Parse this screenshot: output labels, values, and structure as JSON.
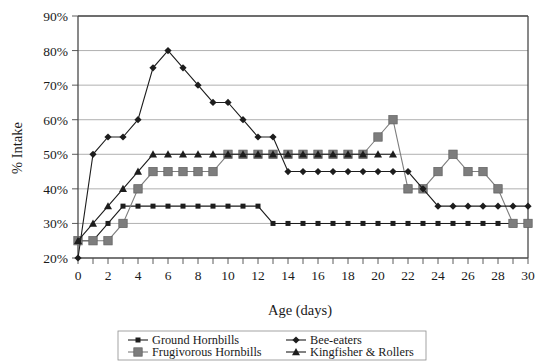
{
  "chart_data": {
    "type": "line",
    "title": "",
    "xlabel": "Age (days)",
    "ylabel": "% Intake",
    "xlim": [
      0,
      30
    ],
    "ylim": [
      20,
      90
    ],
    "x_tick_step": 2,
    "x_minor_tick_step": 1,
    "y_tick_step": 10,
    "grid": "horizontal",
    "y_tick_labels": [
      "90%",
      "80%",
      "70%",
      "60%",
      "50%",
      "40%",
      "30%",
      "20%"
    ],
    "x_tick_labels": [
      "0",
      "2",
      "4",
      "6",
      "8",
      "10",
      "12",
      "14",
      "16",
      "18",
      "20",
      "22",
      "24",
      "26",
      "28",
      "30"
    ],
    "legend_position": "bottom",
    "series": [
      {
        "name": "Ground Hornbills",
        "marker": "square-small",
        "color": "#1d1d1d",
        "x": [
          0,
          1,
          2,
          3,
          4,
          5,
          6,
          7,
          8,
          9,
          10,
          11,
          12,
          13,
          14,
          15,
          16,
          17,
          18,
          19,
          20,
          21,
          22,
          23,
          24,
          25,
          26,
          27,
          28,
          29,
          30
        ],
        "y": [
          25,
          25,
          30,
          35,
          35,
          35,
          35,
          35,
          35,
          35,
          35,
          35,
          35,
          30,
          30,
          30,
          30,
          30,
          30,
          30,
          30,
          30,
          30,
          30,
          30,
          30,
          30,
          30,
          30,
          30,
          30
        ]
      },
      {
        "name": "Frugivorous Hornbills",
        "marker": "square-large",
        "color": "#7d7d7d",
        "x": [
          0,
          1,
          2,
          3,
          4,
          5,
          6,
          7,
          8,
          9,
          10,
          11,
          12,
          13,
          14,
          15,
          16,
          17,
          18,
          19,
          20,
          21,
          22,
          23,
          24,
          25,
          26,
          27,
          28,
          29,
          30
        ],
        "y": [
          25,
          25,
          25,
          30,
          40,
          45,
          45,
          45,
          45,
          45,
          50,
          50,
          50,
          50,
          50,
          50,
          50,
          50,
          50,
          50,
          55,
          60,
          40,
          40,
          45,
          50,
          45,
          45,
          40,
          30,
          30
        ]
      },
      {
        "name": "Bee-eaters",
        "marker": "diamond",
        "color": "#1d1d1d",
        "x": [
          0,
          1,
          2,
          3,
          4,
          5,
          6,
          7,
          8,
          9,
          10,
          11,
          12,
          13,
          14,
          15,
          16,
          17,
          18,
          19,
          20,
          21,
          22,
          23,
          24,
          25,
          26,
          27,
          28,
          29,
          30
        ],
        "y": [
          20,
          50,
          55,
          55,
          60,
          75,
          80,
          75,
          70,
          65,
          65,
          60,
          55,
          55,
          45,
          45,
          45,
          45,
          45,
          45,
          45,
          45,
          45,
          40,
          35,
          35,
          35,
          35,
          35,
          35,
          35
        ]
      },
      {
        "name": "Kingfisher & Rollers",
        "marker": "triangle",
        "color": "#1d1d1d",
        "x": [
          0,
          1,
          2,
          3,
          4,
          5,
          6,
          7,
          8,
          9,
          10,
          11,
          12,
          13,
          14,
          15,
          16,
          17,
          18,
          19,
          20,
          21
        ],
        "y": [
          25,
          30,
          35,
          40,
          45,
          50,
          50,
          50,
          50,
          50,
          50,
          50,
          50,
          50,
          50,
          50,
          50,
          50,
          50,
          50,
          50,
          50
        ]
      }
    ]
  },
  "legend": {
    "entries": [
      {
        "label": "Ground Hornbills"
      },
      {
        "label": "Bee-eaters"
      },
      {
        "label": "Frugivorous Hornbills"
      },
      {
        "label": "Kingfisher & Rollers"
      }
    ]
  }
}
